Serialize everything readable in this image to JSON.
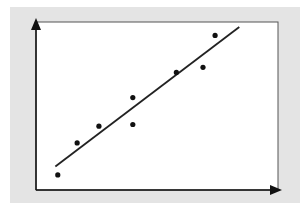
{
  "chart_data": {
    "type": "scatter",
    "title": "",
    "xlabel": "",
    "ylabel": "",
    "xlim": [
      0,
      10
    ],
    "ylim": [
      0,
      10
    ],
    "grid": false,
    "legend": "none",
    "ticks": "none",
    "colors": {
      "panel": "#e4e4e4",
      "plot_bg": "#ffffff",
      "frame": "#555555",
      "axis": "#111111",
      "points": "#111111",
      "trendline": "#222222"
    },
    "series": [
      {
        "name": "observations",
        "x": [
          0.9,
          1.7,
          2.6,
          4.0,
          4.0,
          5.8,
          6.9,
          7.4
        ],
        "y": [
          0.9,
          2.8,
          3.8,
          5.5,
          3.9,
          7.0,
          7.3,
          9.2
        ]
      }
    ],
    "trendline": {
      "name": "line-of-best-fit",
      "x": [
        0.8,
        8.4
      ],
      "y": [
        1.4,
        9.7
      ]
    }
  }
}
